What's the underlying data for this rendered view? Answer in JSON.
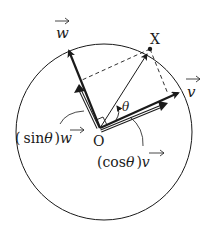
{
  "diagram": {
    "labels": {
      "origin": "O",
      "point_x": "X",
      "vec_w": "w",
      "vec_v": "v",
      "theta": "θ",
      "sin_open": "(",
      "sin_func": "sin",
      "sin_theta": "θ",
      "sin_close": ")",
      "sin_vec": "w",
      "cos_open": "(",
      "cos_func": "cos",
      "cos_theta": "θ",
      "cos_close": ")",
      "cos_vec": "v"
    },
    "colors": {
      "stroke": "#1a1a1a",
      "background": "#ffffff"
    }
  }
}
